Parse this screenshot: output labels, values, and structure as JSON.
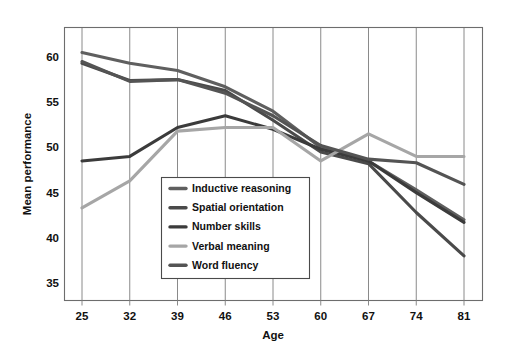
{
  "chart_data": {
    "type": "line",
    "title": "",
    "xlabel": "Age",
    "ylabel": "Mean performance",
    "x": [
      25,
      32,
      39,
      46,
      53,
      60,
      67,
      74,
      81
    ],
    "xtick_labels": [
      "25",
      "32",
      "39",
      "46",
      "53",
      "60",
      "67",
      "74",
      "81"
    ],
    "ytick_labels": [
      "35",
      "40",
      "45",
      "50",
      "55",
      "60"
    ],
    "yticks": [
      35,
      40,
      45,
      50,
      55,
      60
    ],
    "xlim": [
      21,
      85
    ],
    "ylim": [
      32.6,
      62.5
    ],
    "grid": "vertical",
    "legend_position": "lower-center-left",
    "series": [
      {
        "name": "Inductive reasoning",
        "color": "#5f5f5f",
        "values": [
          60.5,
          59.3,
          58.5,
          56.7,
          54.0,
          50.0,
          48.5,
          45.3,
          42.0
        ]
      },
      {
        "name": "Spatial orientation",
        "color": "#4a4a4a",
        "values": [
          59.3,
          57.4,
          57.5,
          56.3,
          53.0,
          49.5,
          48.2,
          42.8,
          38.0
        ]
      },
      {
        "name": "Number skills",
        "color": "#3b3b3b",
        "values": [
          48.5,
          49.0,
          52.2,
          53.5,
          52.0,
          49.8,
          48.5,
          45.0,
          41.7
        ]
      },
      {
        "name": "Verbal meaning",
        "color": "#a6a6a6",
        "values": [
          43.3,
          46.3,
          51.8,
          52.2,
          52.2,
          48.5,
          51.5,
          49.0,
          49.0
        ]
      },
      {
        "name": "Word fluency",
        "color": "#545454",
        "values": [
          59.5,
          57.3,
          57.5,
          56.0,
          53.5,
          50.2,
          48.7,
          48.3,
          45.9
        ]
      }
    ]
  },
  "axes": {
    "x_title": "Age",
    "y_title": "Mean performance"
  },
  "legend": {
    "items": [
      {
        "label": "Inductive reasoning"
      },
      {
        "label": "Spatial orientation"
      },
      {
        "label": "Number skills"
      },
      {
        "label": "Verbal meaning"
      },
      {
        "label": "Word fluency"
      }
    ]
  },
  "colors": {
    "frame": "#6d6d6d",
    "grid": "#8a8a8a",
    "text": "#111111",
    "background": "#ffffff"
  }
}
